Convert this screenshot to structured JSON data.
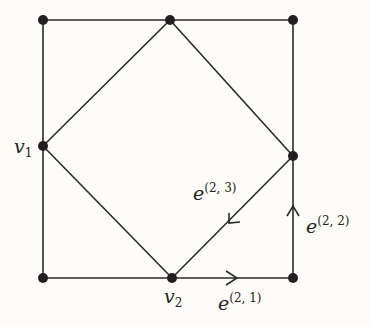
{
  "diagram": {
    "stroke_color": "#2a2a2a",
    "vertex_color": "#231f20",
    "vertices": [
      {
        "id": "top-left",
        "x": 43,
        "y": 20
      },
      {
        "id": "top-mid",
        "x": 170,
        "y": 20
      },
      {
        "id": "top-right",
        "x": 293,
        "y": 20
      },
      {
        "id": "v1",
        "x": 43,
        "y": 146
      },
      {
        "id": "right-mid",
        "x": 293,
        "y": 156
      },
      {
        "id": "bottom-left",
        "x": 43,
        "y": 278
      },
      {
        "id": "v2",
        "x": 172,
        "y": 278
      },
      {
        "id": "bottom-right",
        "x": 293,
        "y": 278
      }
    ],
    "labels": {
      "v1": {
        "base": "v",
        "sub": "1"
      },
      "v2": {
        "base": "v",
        "sub": "2"
      },
      "e21": {
        "base": "e",
        "sup": "(2, 1)"
      },
      "e22": {
        "base": "e",
        "sup": "(2, 2)"
      },
      "e23": {
        "base": "e",
        "sup": "(2, 3)"
      }
    }
  }
}
